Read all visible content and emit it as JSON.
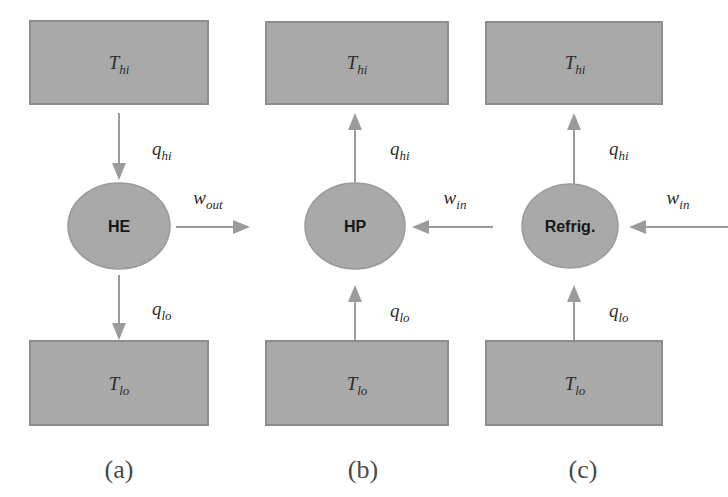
{
  "figure": {
    "background_color": "#ffffff",
    "block_fill_color": "#a9a9a9",
    "block_stroke_color": "#8d8d8d",
    "arrow_color": "#9b9b9b",
    "text_color": "#2b2b2b"
  },
  "panels": [
    {
      "caption": "(a)",
      "device_label": "HE",
      "device_full_name": "heat engine",
      "hot_reservoir_label": "T",
      "hot_reservoir_sub": "hi",
      "cold_reservoir_label": "T",
      "cold_reservoir_sub": "lo",
      "heat_hi_label": "q",
      "heat_hi_sub": "hi",
      "heat_hi_direction": "down",
      "heat_lo_label": "q",
      "heat_lo_sub": "lo",
      "heat_lo_direction": "down",
      "work_label": "w",
      "work_sub": "out",
      "work_direction": "right"
    },
    {
      "caption": "(b)",
      "device_label": "HP",
      "device_full_name": "heat pump",
      "hot_reservoir_label": "T",
      "hot_reservoir_sub": "hi",
      "cold_reservoir_label": "T",
      "cold_reservoir_sub": "lo",
      "heat_hi_label": "q",
      "heat_hi_sub": "hi",
      "heat_hi_direction": "up",
      "heat_lo_label": "q",
      "heat_lo_sub": "lo",
      "heat_lo_direction": "up",
      "work_label": "w",
      "work_sub": "in",
      "work_direction": "left"
    },
    {
      "caption": "(c)",
      "device_label": "Refrig.",
      "device_full_name": "refrigerator",
      "hot_reservoir_label": "T",
      "hot_reservoir_sub": "hi",
      "cold_reservoir_label": "T",
      "cold_reservoir_sub": "lo",
      "heat_hi_label": "q",
      "heat_hi_sub": "hi",
      "heat_hi_direction": "up",
      "heat_lo_label": "q",
      "heat_lo_sub": "lo",
      "heat_lo_direction": "up",
      "work_label": "w",
      "work_sub": "in",
      "work_direction": "left"
    }
  ]
}
